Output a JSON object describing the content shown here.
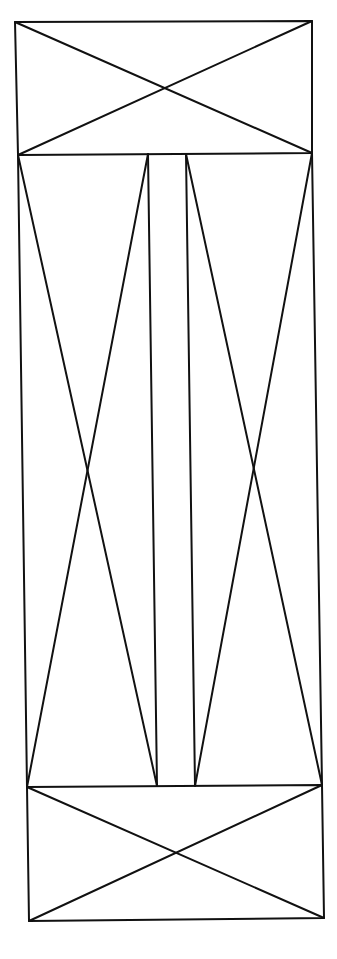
{
  "diagram": {
    "stroke_color": "#111111",
    "background": "#ffffff",
    "stroke_width": 2,
    "top_panel": {
      "corners": [
        [
          15,
          22
        ],
        [
          312,
          21
        ],
        [
          312,
          153
        ],
        [
          18,
          155
        ]
      ],
      "diagonals": [
        [
          [
            15,
            22
          ],
          [
            312,
            153
          ]
        ],
        [
          [
            312,
            21
          ],
          [
            18,
            155
          ]
        ]
      ]
    },
    "bottom_panel": {
      "corners": [
        [
          27,
          787
        ],
        [
          322,
          785
        ],
        [
          324,
          918
        ],
        [
          29,
          921
        ]
      ],
      "diagonals": [
        [
          [
            27,
            787
          ],
          [
            324,
            918
          ]
        ],
        [
          [
            322,
            785
          ],
          [
            29,
            921
          ]
        ]
      ]
    },
    "middle_left_panel": {
      "edges": [
        [
          [
            18,
            155
          ],
          [
            27,
            787
          ]
        ],
        [
          [
            148,
            154
          ],
          [
            157,
            786
          ]
        ]
      ],
      "diagonals": [
        [
          [
            18,
            155
          ],
          [
            157,
            786
          ]
        ],
        [
          [
            148,
            154
          ],
          [
            27,
            787
          ]
        ]
      ]
    },
    "middle_right_panel": {
      "edges": [
        [
          [
            186,
            154
          ],
          [
            195,
            786
          ]
        ],
        [
          [
            312,
            153
          ],
          [
            322,
            785
          ]
        ]
      ],
      "diagonals": [
        [
          [
            186,
            154
          ],
          [
            322,
            785
          ]
        ],
        [
          [
            312,
            153
          ],
          [
            195,
            786
          ]
        ]
      ]
    }
  }
}
